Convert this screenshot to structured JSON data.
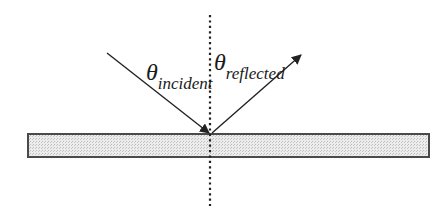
{
  "diagram": {
    "labels": {
      "incident": {
        "symbol": "θ",
        "subscript": "incident"
      },
      "reflected": {
        "symbol": "θ",
        "subscript": "reflected"
      }
    },
    "elements": {
      "surface": "reflecting surface",
      "normal": "normal line (dotted)",
      "incident_ray": "incident ray",
      "reflected_ray": "reflected ray"
    },
    "colors": {
      "stroke": "#222222",
      "surface_fill": "#e4e4e4",
      "surface_border": "#4a4a4a",
      "background": "#ffffff"
    }
  }
}
